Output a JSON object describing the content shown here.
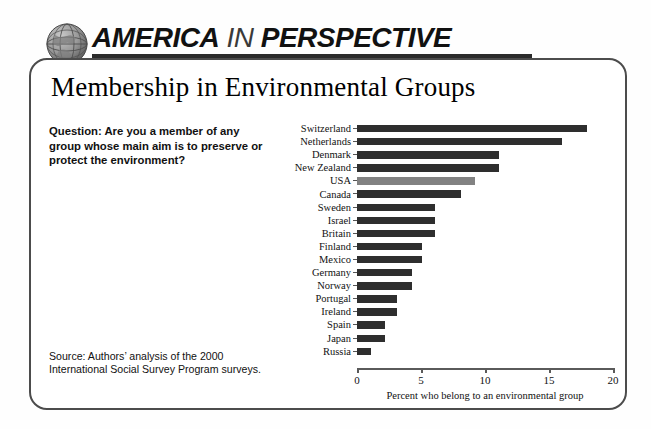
{
  "header": {
    "title_part_1": "AMERICA",
    "title_part_2": "IN",
    "title_part_3": "PERSPECTIVE",
    "globe_icon": "globe-icon"
  },
  "card": {
    "title": "Membership in Environmental Groups",
    "question": "Question: Are you a member of any group whose main aim is to preserve or protect the environment?",
    "source": "Source: Authors’ analysis of the 2000 International Social Survey Program surveys."
  },
  "colors": {
    "bar": "#2e2e2e",
    "bar_highlight": "#828282",
    "border": "#4c4c4c",
    "axis": "#5a5a5a"
  },
  "chart_data": {
    "type": "bar",
    "orientation": "horizontal",
    "title": "Membership in Environmental Groups",
    "xlabel": "Percent who belong to an environmental group",
    "ylabel": "",
    "xlim": [
      0,
      20
    ],
    "xticks": [
      0,
      5,
      10,
      15,
      20
    ],
    "xtick_labels": [
      "0",
      "5",
      "10",
      "15",
      "20"
    ],
    "grid": false,
    "legend": false,
    "highlight_category": "USA",
    "categories": [
      "Switzerland",
      "Netherlands",
      "Denmark",
      "New Zealand",
      "USA",
      "Canada",
      "Sweden",
      "Israel",
      "Britain",
      "Finland",
      "Mexico",
      "Germany",
      "Norway",
      "Portugal",
      "Ireland",
      "Spain",
      "Japan",
      "Russia"
    ],
    "values": [
      18.0,
      16.0,
      11.1,
      11.1,
      9.2,
      8.1,
      6.1,
      6.1,
      6.1,
      5.1,
      5.1,
      4.3,
      4.3,
      3.1,
      3.1,
      2.2,
      2.2,
      1.1
    ]
  }
}
